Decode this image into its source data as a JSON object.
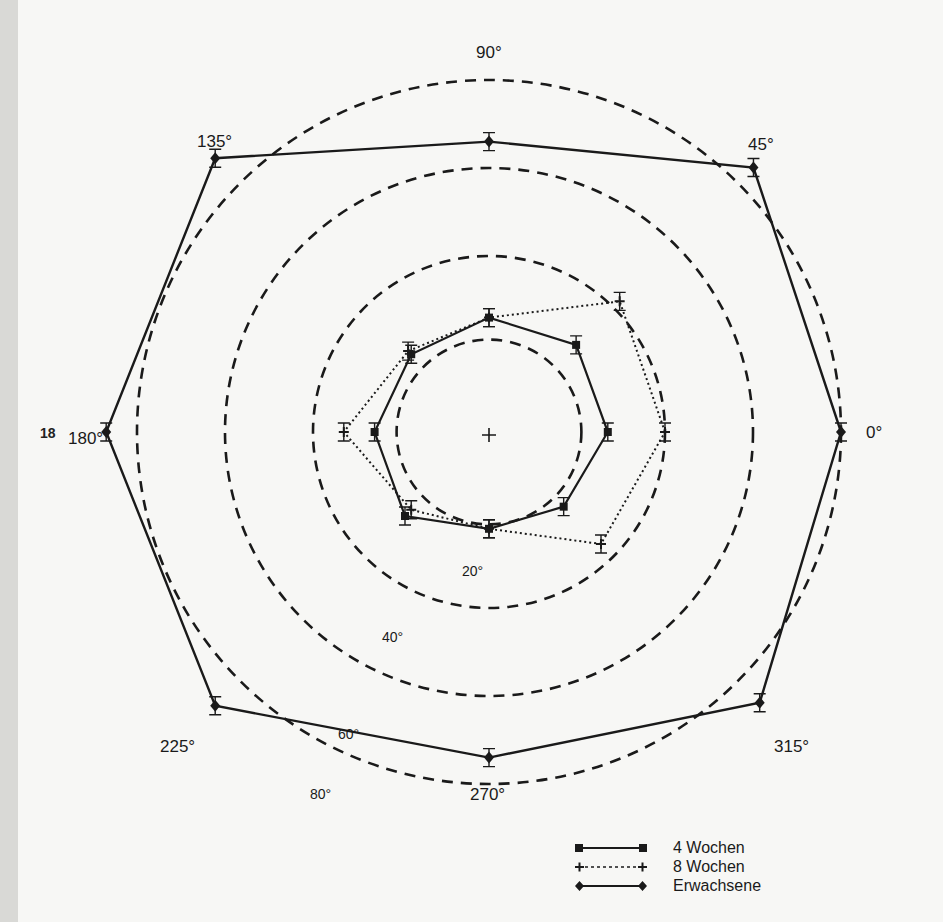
{
  "page": {
    "margin_marker": "18"
  },
  "chart_data": {
    "type": "polar-line",
    "title": "",
    "angles_deg": [
      0,
      45,
      90,
      135,
      180,
      225,
      270,
      315
    ],
    "angle_labels": [
      "0°",
      "45°",
      "90°",
      "135°",
      "180°",
      "225°",
      "270°",
      "315°"
    ],
    "rings_deg": [
      20,
      40,
      60,
      80
    ],
    "ring_labels": [
      "20°",
      "40°",
      "60°",
      "80°"
    ],
    "series": [
      {
        "name": "4 Wochen",
        "style": "solid-square",
        "values": [
          27,
          28,
          26,
          25,
          26,
          27,
          22,
          24
        ]
      },
      {
        "name": "8 Wochen",
        "style": "dotted-plus",
        "values": [
          40,
          42,
          26,
          26,
          33,
          25,
          22,
          36
        ]
      },
      {
        "name": "Erwachsene",
        "style": "solid-diamond",
        "values": [
          80,
          85,
          66,
          88,
          87,
          88,
          74,
          87
        ]
      }
    ],
    "legend_position": "bottom-right",
    "grid": "dashed concentric rings"
  },
  "legend": {
    "items": [
      {
        "label": "4 Wochen"
      },
      {
        "label": "8 Wochen"
      },
      {
        "label": "Erwachsene"
      }
    ]
  }
}
